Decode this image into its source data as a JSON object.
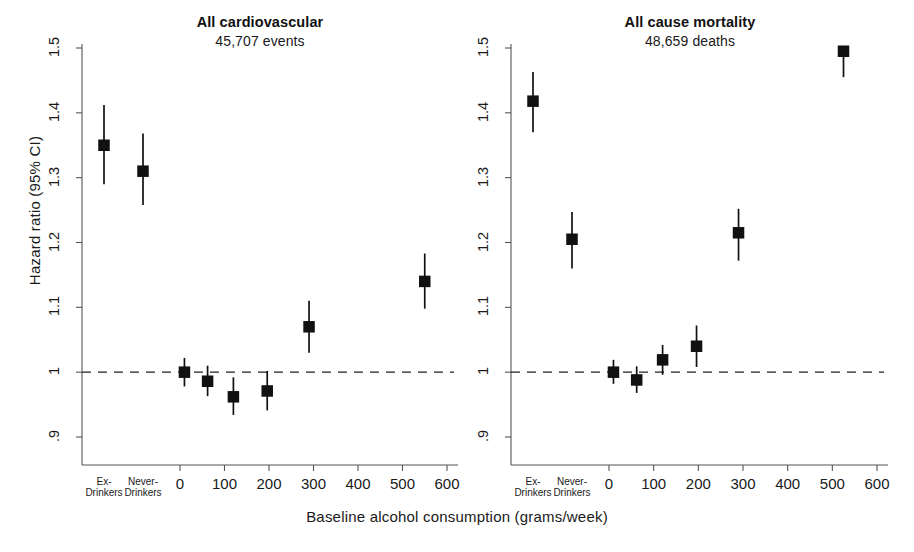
{
  "figure": {
    "xlabel": "Baseline alcohol consumption (grams/week)",
    "ylabel": "Hazard ratio (95% CI)"
  },
  "chart_data": {
    "type": "scatter",
    "title": "",
    "xlabel": "Baseline alcohol consumption (grams/week)",
    "ylabel": "Hazard ratio (95% CI)",
    "ylim": [
      0.9,
      1.5
    ],
    "xlim": [
      0,
      600
    ],
    "grid": false,
    "legend": null,
    "reference_line": {
      "y": 1,
      "style": "dashed"
    },
    "ytick_labels": [
      "1.5",
      "1.4",
      "1.3",
      "1.2",
      "1.1",
      "1",
      ".9"
    ],
    "ytick_values": [
      1.5,
      1.4,
      1.3,
      1.2,
      1.1,
      1.0,
      0.9
    ],
    "xtick_labels": [
      "0",
      "100",
      "200",
      "300",
      "400",
      "500",
      "600"
    ],
    "xtick_values": [
      0,
      100,
      200,
      300,
      400,
      500,
      600
    ],
    "category_ticks": [
      {
        "label_line1": "Ex-",
        "label_line2": "Drinkers"
      },
      {
        "label_line1": "Never-",
        "label_line2": "Drinkers"
      }
    ],
    "panels": [
      {
        "title": "All cardiovascular",
        "subtitle": "45,707 events",
        "points": [
          {
            "category": "Ex-Drinkers",
            "x": null,
            "hr": 1.35,
            "ci_low": 1.29,
            "ci_high": 1.412
          },
          {
            "category": "Never-Drinkers",
            "x": null,
            "hr": 1.31,
            "ci_low": 1.258,
            "ci_high": 1.368
          },
          {
            "category": null,
            "x": 10,
            "hr": 1.0,
            "ci_low": 0.978,
            "ci_high": 1.022
          },
          {
            "category": null,
            "x": 62,
            "hr": 0.986,
            "ci_low": 0.963,
            "ci_high": 1.01
          },
          {
            "category": null,
            "x": 120,
            "hr": 0.962,
            "ci_low": 0.934,
            "ci_high": 0.992
          },
          {
            "category": null,
            "x": 196,
            "hr": 0.971,
            "ci_low": 0.941,
            "ci_high": 1.002
          },
          {
            "category": null,
            "x": 290,
            "hr": 1.07,
            "ci_low": 1.03,
            "ci_high": 1.11
          },
          {
            "category": null,
            "x": 550,
            "hr": 1.14,
            "ci_low": 1.098,
            "ci_high": 1.183
          }
        ]
      },
      {
        "title": "All cause mortality",
        "subtitle": "48,659 deaths",
        "points": [
          {
            "category": "Ex-Drinkers",
            "x": null,
            "hr": 1.418,
            "ci_low": 1.37,
            "ci_high": 1.463
          },
          {
            "category": "Never-Drinkers",
            "x": null,
            "hr": 1.205,
            "ci_low": 1.16,
            "ci_high": 1.247
          },
          {
            "category": null,
            "x": 10,
            "hr": 1.0,
            "ci_low": 0.982,
            "ci_high": 1.019
          },
          {
            "category": null,
            "x": 62,
            "hr": 0.988,
            "ci_low": 0.968,
            "ci_high": 1.009
          },
          {
            "category": null,
            "x": 120,
            "hr": 1.019,
            "ci_low": 0.996,
            "ci_high": 1.042
          },
          {
            "category": null,
            "x": 196,
            "hr": 1.04,
            "ci_low": 1.008,
            "ci_high": 1.072
          },
          {
            "category": null,
            "x": 290,
            "hr": 1.215,
            "ci_low": 1.172,
            "ci_high": 1.252
          },
          {
            "category": null,
            "x": 525,
            "hr": 1.495,
            "ci_low": 1.455,
            "ci_high": 1.5
          }
        ]
      }
    ],
    "marker": {
      "shape": "square",
      "color": "#111111"
    },
    "line_color": "#111111"
  }
}
